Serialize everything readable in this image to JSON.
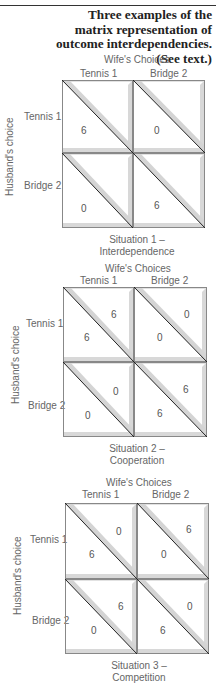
{
  "caption": "Three examples of the matrix representation of outcome interdependencies. (See text.)",
  "labels": {
    "wife": "Wife's Choices",
    "husband": "Husband's choice",
    "col1": "Tennis 1",
    "col2": "Bridge 2",
    "row1": "Tennis 1",
    "row2": "Bridge 2"
  },
  "situations": [
    {
      "title_line1": "Situation 1 –",
      "title_line2": "Interdependence",
      "cells": {
        "tt": {
          "husband": "6",
          "wife": ""
        },
        "tb": {
          "husband": "0",
          "wife": ""
        },
        "bt": {
          "husband": "0",
          "wife": ""
        },
        "bb": {
          "husband": "6",
          "wife": ""
        }
      }
    },
    {
      "title_line1": "Situation 2 –",
      "title_line2": "Cooperation",
      "cells": {
        "tt": {
          "husband": "6",
          "wife": "6"
        },
        "tb": {
          "husband": "0",
          "wife": "0"
        },
        "bt": {
          "husband": "0",
          "wife": "0"
        },
        "bb": {
          "husband": "6",
          "wife": "6"
        }
      }
    },
    {
      "title_line1": "Situation 3 –",
      "title_line2": "Competition",
      "cells": {
        "tt": {
          "husband": "6",
          "wife": "0"
        },
        "tb": {
          "husband": "0",
          "wife": "6"
        },
        "bt": {
          "husband": "0",
          "wife": "6"
        },
        "bb": {
          "husband": "6",
          "wife": "0"
        }
      }
    }
  ],
  "chart_data": {
    "type": "table",
    "title": "Three examples of the matrix representation of outcome interdependencies. (See text.)",
    "row_label": "Husband's choice",
    "col_label": "Wife's Choices",
    "rows": [
      "Tennis 1",
      "Bridge 2"
    ],
    "cols": [
      "Tennis 1",
      "Bridge 2"
    ],
    "matrices": [
      {
        "name": "Situation 1 – Interdependence",
        "husband": [
          [
            6,
            0
          ],
          [
            0,
            6
          ]
        ],
        "wife": [
          [
            null,
            null
          ],
          [
            null,
            null
          ]
        ]
      },
      {
        "name": "Situation 2 – Cooperation",
        "husband": [
          [
            6,
            0
          ],
          [
            0,
            6
          ]
        ],
        "wife": [
          [
            6,
            0
          ],
          [
            0,
            6
          ]
        ]
      },
      {
        "name": "Situation 3 – Competition",
        "husband": [
          [
            6,
            0
          ],
          [
            0,
            6
          ]
        ],
        "wife": [
          [
            0,
            6
          ],
          [
            6,
            0
          ]
        ]
      }
    ]
  }
}
